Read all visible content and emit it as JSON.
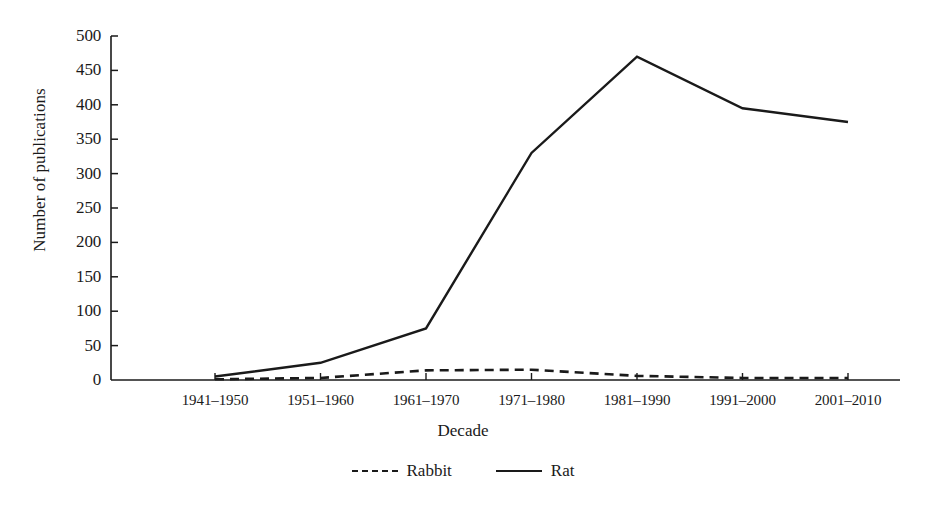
{
  "chart_data": {
    "type": "line",
    "title": "",
    "xlabel": "Decade",
    "ylabel": "Number of publications",
    "categories": [
      "1941–1950",
      "1951–1960",
      "1961–1970",
      "1971–1980",
      "1981–1990",
      "1991–2000",
      "2001–2010"
    ],
    "series": [
      {
        "name": "Rabbit",
        "style": "dashed",
        "values": [
          1,
          3,
          14,
          15,
          6,
          3,
          3
        ]
      },
      {
        "name": "Rat",
        "style": "solid",
        "values": [
          5,
          25,
          75,
          330,
          470,
          395,
          375
        ]
      }
    ],
    "ylim": [
      0,
      500
    ],
    "yticks": [
      0,
      50,
      100,
      150,
      200,
      250,
      300,
      350,
      400,
      450,
      500
    ],
    "ytick_labels": [
      "0",
      "50",
      "100",
      "150",
      "200",
      "250",
      "300",
      "350",
      "400",
      "450",
      "500"
    ],
    "grid": false,
    "legend_position": "bottom-center",
    "line_color": "#1a1a1a",
    "background_color": "#ffffff"
  },
  "legend": {
    "items": [
      {
        "label": "Rabbit",
        "style": "dashed"
      },
      {
        "label": "Rat",
        "style": "solid"
      }
    ]
  }
}
